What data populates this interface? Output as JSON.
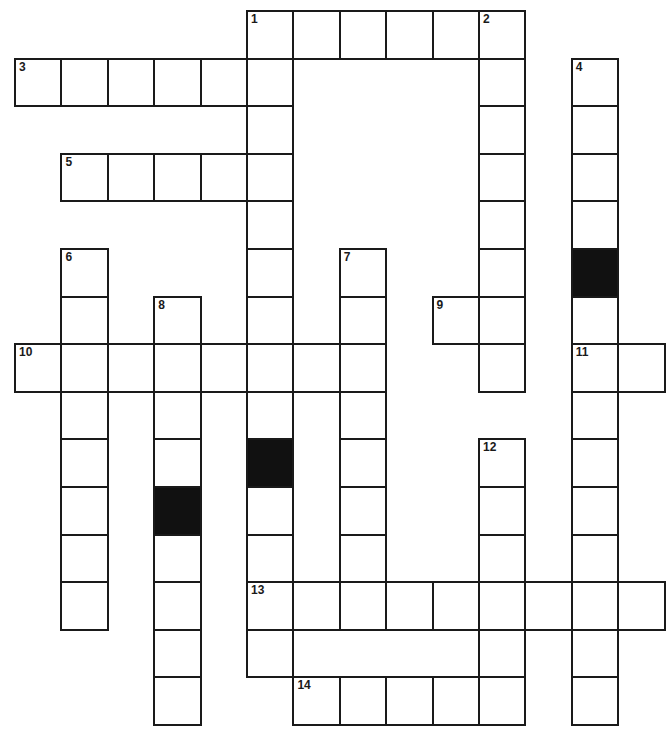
{
  "puzzle": {
    "type": "crossword",
    "origin": {
      "x": 14,
      "y": 10
    },
    "cell_width": 46.4,
    "cell_height": 47.6,
    "colors": {
      "line": "#1a1a1a",
      "block": "#111111",
      "background": "#ffffff"
    },
    "entries": [
      {
        "number": "1",
        "direction": "across",
        "row": 0,
        "col": 5,
        "length": 6
      },
      {
        "number": "1",
        "direction": "down",
        "row": 0,
        "col": 5,
        "length": 14,
        "blocked_rows": [
          9
        ]
      },
      {
        "number": "2",
        "direction": "down",
        "row": 0,
        "col": 10,
        "length": 8
      },
      {
        "number": "3",
        "direction": "across",
        "row": 1,
        "col": 0,
        "length": 6
      },
      {
        "number": "4",
        "direction": "down",
        "row": 1,
        "col": 12,
        "length": 14,
        "blocked_rows": [
          5
        ]
      },
      {
        "number": "5",
        "direction": "across",
        "row": 3,
        "col": 1,
        "length": 5
      },
      {
        "number": "6",
        "direction": "down",
        "row": 5,
        "col": 1,
        "length": 8
      },
      {
        "number": "7",
        "direction": "down",
        "row": 5,
        "col": 7,
        "length": 8
      },
      {
        "number": "8",
        "direction": "down",
        "row": 6,
        "col": 3,
        "length": 9,
        "blocked_rows": [
          10
        ]
      },
      {
        "number": "9",
        "direction": "across",
        "row": 6,
        "col": 9,
        "length": 2
      },
      {
        "number": "10",
        "direction": "across",
        "row": 7,
        "col": 0,
        "length": 8
      },
      {
        "number": "11",
        "direction": "across",
        "row": 7,
        "col": 12,
        "length": 2
      },
      {
        "number": "12",
        "direction": "down",
        "row": 9,
        "col": 10,
        "length": 6
      },
      {
        "number": "13",
        "direction": "across",
        "row": 12,
        "col": 5,
        "length": 9
      },
      {
        "number": "14",
        "direction": "across",
        "row": 14,
        "col": 6,
        "length": 5
      }
    ],
    "black_cells": [
      {
        "row": 9,
        "col": 5
      },
      {
        "row": 5,
        "col": 12
      },
      {
        "row": 10,
        "col": 3
      }
    ],
    "numbers": [
      {
        "label": "1",
        "row": 0,
        "col": 5
      },
      {
        "label": "2",
        "row": 0,
        "col": 10
      },
      {
        "label": "3",
        "row": 1,
        "col": 0
      },
      {
        "label": "4",
        "row": 1,
        "col": 12
      },
      {
        "label": "5",
        "row": 3,
        "col": 1
      },
      {
        "label": "6",
        "row": 5,
        "col": 1
      },
      {
        "label": "7",
        "row": 5,
        "col": 7
      },
      {
        "label": "8",
        "row": 6,
        "col": 3
      },
      {
        "label": "9",
        "row": 6,
        "col": 9
      },
      {
        "label": "10",
        "row": 7,
        "col": 0
      },
      {
        "label": "11",
        "row": 7,
        "col": 12
      },
      {
        "label": "12",
        "row": 9,
        "col": 10
      },
      {
        "label": "13",
        "row": 12,
        "col": 5
      },
      {
        "label": "14",
        "row": 14,
        "col": 6
      }
    ]
  }
}
